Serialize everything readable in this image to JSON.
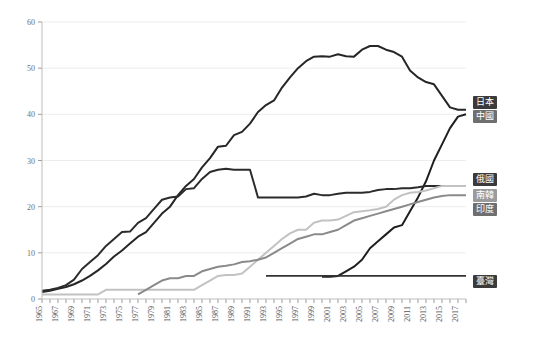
{
  "chart_data": {
    "type": "line",
    "title": "",
    "xlabel": "",
    "ylabel": "",
    "ylim": [
      0,
      60
    ],
    "yticks": [
      0,
      10,
      20,
      30,
      40,
      50,
      60
    ],
    "grid": true,
    "legend_position": "right-inline",
    "x": [
      1965,
      1966,
      1967,
      1968,
      1969,
      1970,
      1971,
      1972,
      1973,
      1974,
      1975,
      1976,
      1977,
      1978,
      1979,
      1980,
      1981,
      1982,
      1983,
      1984,
      1985,
      1986,
      1987,
      1988,
      1989,
      1990,
      1991,
      1992,
      1993,
      1994,
      1995,
      1996,
      1997,
      1998,
      1999,
      2000,
      2001,
      2002,
      2003,
      2004,
      2005,
      2006,
      2007,
      2008,
      2009,
      2010,
      2011,
      2012,
      2013,
      2014,
      2015,
      2016,
      2017,
      2018
    ],
    "xtick_labels": [
      "1965",
      "1967",
      "1969",
      "1971",
      "1973",
      "1975",
      "1977",
      "1979",
      "1981",
      "1983",
      "1985",
      "1987",
      "1989",
      "1991",
      "1993",
      "1995",
      "1997",
      "1999",
      "2001",
      "2003",
      "2005",
      "2007",
      "2009",
      "2011",
      "2013",
      "2015",
      "2017"
    ],
    "series": [
      {
        "name": "日本",
        "color": "#262626",
        "width": 2.0,
        "values": [
          1.5,
          1.8,
          2.2,
          2.6,
          3.2,
          4.0,
          5.0,
          6.2,
          7.6,
          9.2,
          10.5,
          12.0,
          13.5,
          14.5,
          16.5,
          18.5,
          20.0,
          22.5,
          24.5,
          26.0,
          28.5,
          30.5,
          33.0,
          33.2,
          35.5,
          36.2,
          38.0,
          40.5,
          42.0,
          43.0,
          45.8,
          48.0,
          50.0,
          51.5,
          52.5,
          52.6,
          52.5,
          53.0,
          52.6,
          52.5,
          54.0,
          54.8,
          54.8,
          54.0,
          53.5,
          52.5,
          49.5,
          48.0,
          47.0,
          46.5,
          44.0,
          41.5,
          41.0,
          41.0
        ]
      },
      {
        "name": "中國",
        "color": "#1f1f1f",
        "width": 2.0,
        "values": [
          null,
          null,
          null,
          null,
          null,
          null,
          null,
          null,
          null,
          null,
          null,
          null,
          null,
          null,
          null,
          null,
          null,
          null,
          null,
          null,
          null,
          null,
          null,
          null,
          null,
          null,
          null,
          null,
          null,
          null,
          null,
          null,
          null,
          null,
          null,
          4.8,
          4.8,
          5.0,
          6.0,
          7.0,
          8.5,
          11.0,
          12.5,
          14.0,
          15.5,
          16.0,
          19.0,
          22.0,
          25.5,
          30.0,
          33.5,
          37.0,
          39.5,
          40.0
        ]
      },
      {
        "name": "俄國",
        "color": "#2b2b2b",
        "width": 2.0,
        "values": [
          1.8,
          2.0,
          2.4,
          3.0,
          4.2,
          6.5,
          8.0,
          9.5,
          11.5,
          13.0,
          14.5,
          14.6,
          16.5,
          17.5,
          19.5,
          21.5,
          22.0,
          22.2,
          23.8,
          24.0,
          26.0,
          27.5,
          28.0,
          28.2,
          28.0,
          28.0,
          28.0,
          22.0,
          22.0,
          22.0,
          22.0,
          22.0,
          22.0,
          22.2,
          22.8,
          22.5,
          22.5,
          22.8,
          23.0,
          23.0,
          23.0,
          23.2,
          23.6,
          23.8,
          23.8,
          24.0,
          24.0,
          24.2,
          24.5,
          24.5,
          24.5,
          24.5,
          24.5,
          24.5
        ]
      },
      {
        "name": "南韓",
        "color": "#c2c2c2",
        "width": 2.0,
        "values": [
          1.0,
          1.0,
          1.0,
          1.0,
          1.0,
          1.0,
          1.0,
          1.0,
          2.0,
          2.0,
          2.0,
          2.0,
          2.0,
          2.0,
          2.0,
          2.0,
          2.0,
          2.0,
          2.0,
          2.0,
          3.0,
          4.0,
          5.0,
          5.2,
          5.2,
          5.5,
          7.0,
          8.5,
          10.0,
          11.5,
          13.0,
          14.2,
          15.0,
          15.0,
          16.5,
          17.0,
          17.0,
          17.2,
          18.0,
          18.8,
          19.0,
          19.2,
          19.5,
          20.0,
          21.5,
          22.5,
          23.0,
          23.2,
          23.5,
          24.0,
          24.5,
          24.5,
          24.5,
          24.5
        ]
      },
      {
        "name": "印度",
        "color": "#8a8a8a",
        "width": 2.0,
        "values": [
          null,
          null,
          null,
          null,
          null,
          null,
          null,
          null,
          null,
          null,
          null,
          null,
          1.0,
          2.0,
          3.0,
          4.0,
          4.5,
          4.5,
          5.0,
          5.0,
          6.0,
          6.5,
          7.0,
          7.2,
          7.5,
          8.0,
          8.2,
          8.5,
          9.0,
          10.0,
          11.0,
          12.0,
          13.0,
          13.5,
          14.0,
          14.0,
          14.5,
          15.0,
          16.0,
          17.0,
          17.5,
          18.0,
          18.5,
          19.0,
          19.5,
          20.0,
          20.5,
          21.0,
          21.5,
          22.0,
          22.3,
          22.5,
          22.5,
          22.5
        ]
      },
      {
        "name": "臺灣",
        "color": "#333333",
        "width": 1.6,
        "values": [
          null,
          null,
          null,
          null,
          null,
          null,
          null,
          null,
          null,
          null,
          null,
          null,
          null,
          null,
          null,
          null,
          null,
          null,
          null,
          null,
          null,
          null,
          null,
          null,
          null,
          null,
          null,
          null,
          5.0,
          5.0,
          5.0,
          5.0,
          5.0,
          5.0,
          5.0,
          5.0,
          5.0,
          5.0,
          5.0,
          5.0,
          5.0,
          5.0,
          5.0,
          5.0,
          5.0,
          5.0,
          5.0,
          5.0,
          5.0,
          5.0,
          5.0,
          5.0,
          5.0,
          5.0
        ]
      }
    ],
    "legend_labels": [
      {
        "text": "日本",
        "shade": "dark"
      },
      {
        "text": "中國",
        "shade": "mid"
      },
      {
        "text": "俄國",
        "shade": "dark"
      },
      {
        "text": "南韓",
        "shade": "light"
      },
      {
        "text": "印度",
        "shade": "mid"
      },
      {
        "text": "臺灣",
        "shade": "dark"
      }
    ]
  }
}
